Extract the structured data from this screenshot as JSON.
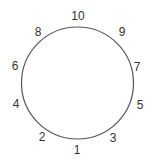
{
  "diagram": {
    "type": "circle-with-numbered-points",
    "circle": {
      "cx": 77.5,
      "cy": 83,
      "r": 56,
      "stroke": "#555555"
    },
    "labels": [
      {
        "text": "10",
        "x": 78,
        "y": 20
      },
      {
        "text": "8",
        "x": 38,
        "y": 36
      },
      {
        "text": "9",
        "x": 122,
        "y": 36
      },
      {
        "text": "6",
        "x": 15,
        "y": 70
      },
      {
        "text": "7",
        "x": 137,
        "y": 71
      },
      {
        "text": "4",
        "x": 16,
        "y": 108
      },
      {
        "text": "5",
        "x": 140,
        "y": 109
      },
      {
        "text": "2",
        "x": 42,
        "y": 141
      },
      {
        "text": "3",
        "x": 113,
        "y": 142
      },
      {
        "text": "1",
        "x": 77,
        "y": 154
      }
    ]
  }
}
